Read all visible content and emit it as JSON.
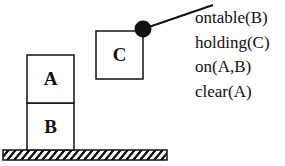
{
  "blocks": [
    {
      "label": "A",
      "state": "stacked on B"
    },
    {
      "label": "B",
      "state": "on table"
    },
    {
      "label": "C",
      "state": "held by gripper"
    }
  ],
  "gripper": {
    "icon": "gripper-joint-icon"
  },
  "ground": {
    "icon": "hatched-table-surface"
  },
  "predicates": [
    "ontable(B)",
    "holding(C)",
    "on(A,B)",
    "clear(A)"
  ]
}
